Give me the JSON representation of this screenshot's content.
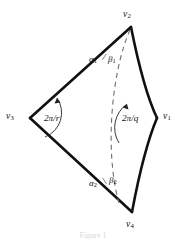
{
  "figure": {
    "caption": "Figure 1",
    "vertices": [
      {
        "id": "v1",
        "label": "v",
        "sub": "1",
        "x": 157,
        "y": 118,
        "label_x": 163,
        "label_y": 112
      },
      {
        "id": "v2",
        "label": "v",
        "sub": "2",
        "x": 131,
        "y": 27,
        "label_x": 123,
        "label_y": 10
      },
      {
        "id": "v3",
        "label": "v",
        "sub": "3",
        "x": 30,
        "y": 118,
        "label_x": 6,
        "label_y": 112
      },
      {
        "id": "v4",
        "label": "v",
        "sub": "4",
        "x": 132,
        "y": 212,
        "label_x": 126,
        "label_y": 220
      }
    ],
    "angles": [
      {
        "id": "angle-r",
        "text": "2π/r",
        "at_vertex": "v3"
      },
      {
        "id": "angle-q",
        "text": "2π/q",
        "at_vertex": "v1"
      }
    ],
    "greek_labels": [
      {
        "id": "alpha1",
        "symbol": "α",
        "sub": "1",
        "at_vertex": "v2"
      },
      {
        "id": "beta1",
        "symbol": "β",
        "sub": "1",
        "at_vertex": "v2"
      },
      {
        "id": "alpha2",
        "symbol": "α",
        "sub": "2",
        "at_vertex": "v4"
      },
      {
        "id": "beta2",
        "symbol": "β",
        "sub": "2",
        "at_vertex": "v4"
      }
    ],
    "separators": {
      "top": "/",
      "bottom": "\\"
    },
    "colors": {
      "stroke": "#111111",
      "dashed_stroke": "#777777",
      "background": "#ffffff",
      "caption": "#d9d9d9"
    },
    "strokes": {
      "outline_width": 2.6,
      "arc_width": 0.9,
      "dashed_width": 1.1,
      "dash_pattern": "5 4"
    }
  }
}
